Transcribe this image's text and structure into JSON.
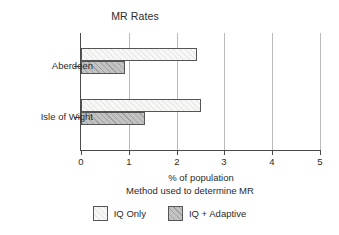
{
  "chart_data": {
    "type": "bar",
    "orientation": "horizontal",
    "title": "MR Rates",
    "xlabel": "% of population",
    "ylabel": "",
    "legend_title": "Method used to determine MR",
    "legend_position": "bottom",
    "grid": true,
    "xlim": [
      0,
      5
    ],
    "xticks": [
      0,
      1,
      2,
      3,
      4,
      5
    ],
    "xtick_labels": [
      "0",
      "1",
      "2",
      "3",
      "4",
      "5"
    ],
    "categories": [
      "Aberdeen",
      "Isle of Wight"
    ],
    "series": [
      {
        "name": "IQ Only",
        "color": "#f7f7f5",
        "values": [
          2.43,
          2.51
        ]
      },
      {
        "name": "IQ + Adaptive",
        "color": "#c3c3c3",
        "values": [
          0.92,
          1.34
        ]
      }
    ]
  },
  "legend": {
    "entries": [
      {
        "label": "IQ Only"
      },
      {
        "label": "IQ + Adaptive"
      }
    ]
  }
}
